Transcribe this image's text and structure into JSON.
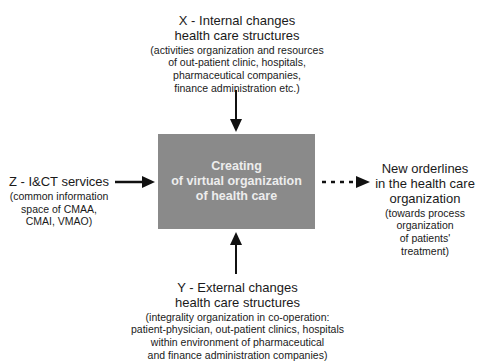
{
  "diagram": {
    "type": "flow",
    "center": {
      "lines": [
        "Creating",
        "of virtual organization",
        "of health care"
      ],
      "fill": "#8a8a8a",
      "text_color": "#ededed"
    },
    "top": {
      "title": [
        "X - Internal changes",
        "health care structures"
      ],
      "sub": [
        "(activities organization and resources",
        "of out-patient clinic, hospitals,",
        "pharmaceutical companies,",
        "finance administration etc.)"
      ]
    },
    "left": {
      "title": [
        "Z - I&CT services"
      ],
      "sub": [
        "(common information",
        "space of CMAA,",
        "CMAI, VMAO)"
      ]
    },
    "right": {
      "title": [
        "New orderlines",
        "in the health care",
        "organization"
      ],
      "sub": [
        "(towards process",
        "organization",
        "of patients'",
        "treatment)"
      ]
    },
    "bottom": {
      "title": [
        "Y - External changes",
        "health care structures"
      ],
      "sub": [
        "(integrality organization in co-operation:",
        "patient-physician, out-patient clinics, hospitals",
        "within environment of pharmaceutical",
        "and finance administration companies)"
      ]
    },
    "edges": [
      {
        "from": "top",
        "to": "center",
        "style": "solid"
      },
      {
        "from": "left",
        "to": "center",
        "style": "solid"
      },
      {
        "from": "bottom",
        "to": "center",
        "style": "solid"
      },
      {
        "from": "center",
        "to": "right",
        "style": "dashed"
      }
    ]
  }
}
